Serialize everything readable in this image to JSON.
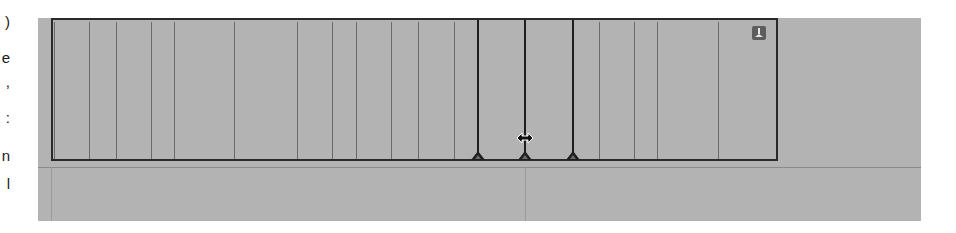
{
  "left_text_fragments": [
    ")",
    "e",
    ",",
    ":",
    "n",
    "l"
  ],
  "timeline": {
    "background_color": "#b3b3b3",
    "clip_border_color": "#2a2a2a",
    "thin_edit_lines_x": [
      54,
      89,
      116,
      151,
      174,
      234,
      297,
      332,
      356,
      391,
      418,
      454,
      599,
      634,
      657,
      718
    ],
    "bold_edit_lines_x": [
      478,
      525,
      573
    ],
    "markers_x": [
      478,
      525,
      573
    ],
    "cursor": "resize-horizontal",
    "corner_icon": "pin-icon"
  }
}
